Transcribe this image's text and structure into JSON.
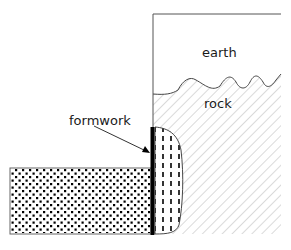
{
  "diagram": {
    "labels": {
      "earth": "earth",
      "rock": "rock",
      "formwork": "formwork"
    },
    "regions": [
      {
        "name": "earth",
        "pattern": "blank"
      },
      {
        "name": "rock",
        "pattern": "diagonal-hatch"
      },
      {
        "name": "concrete-block",
        "pattern": "dense-dots"
      },
      {
        "name": "infill",
        "pattern": "vertical-dashes"
      }
    ],
    "colors": {
      "outline": "#555555",
      "hatch": "#b0b0b0",
      "formwork": "#000000",
      "text": "#1a1a1a"
    }
  }
}
